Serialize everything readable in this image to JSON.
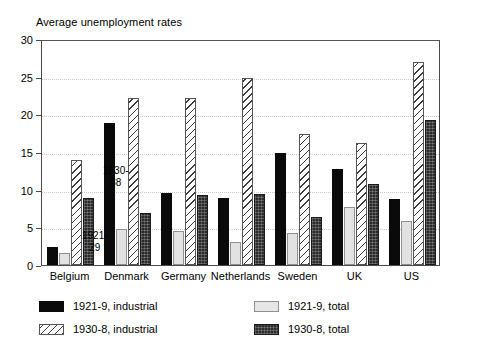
{
  "chart_data": {
    "type": "bar",
    "title": "Average unemployment rates",
    "xlabel": "",
    "ylabel": "",
    "ylim": [
      0,
      30
    ],
    "yticks": [
      0,
      5,
      10,
      15,
      20,
      25,
      30
    ],
    "grid": true,
    "legend_position": "below-plot",
    "categories": [
      "Belgium",
      "Denmark",
      "Germany",
      "Netherlands",
      "Sweden",
      "UK",
      "US"
    ],
    "series": [
      {
        "name": "1921-9, industrial",
        "style": "solid-black",
        "color": "#0a0a0a",
        "values": [
          2.4,
          18.8,
          9.6,
          8.9,
          14.9,
          12.8,
          8.7
        ]
      },
      {
        "name": "1921-9, total",
        "style": "light-gray",
        "color": "#e2e2e2",
        "values": [
          1.6,
          4.8,
          4.5,
          3.0,
          4.2,
          7.7,
          5.9
        ]
      },
      {
        "name": "1930-8, industrial",
        "style": "diagonal-hatch",
        "color": "#ffffff",
        "values": [
          14.0,
          22.2,
          22.2,
          24.8,
          17.4,
          16.2,
          27.0
        ]
      },
      {
        "name": "1930-8, total",
        "style": "dark-stipple",
        "color": "#2b2b2b",
        "values": [
          8.9,
          6.9,
          9.3,
          9.4,
          6.4,
          10.7,
          19.2
        ]
      }
    ],
    "annotations": [
      {
        "id": "1921-29",
        "line1": "1921-",
        "line2": "29"
      },
      {
        "id": "1930-38",
        "line1": "1930-",
        "line2": "38"
      }
    ]
  },
  "legend": {
    "entries": [
      {
        "label": "1921-9, industrial",
        "style": "s-black"
      },
      {
        "label": "1930-8, industrial",
        "style": "s-hatch"
      },
      {
        "label": "1921-9, total",
        "style": "s-light"
      },
      {
        "label": "1930-8, total",
        "style": "s-dark"
      }
    ]
  }
}
